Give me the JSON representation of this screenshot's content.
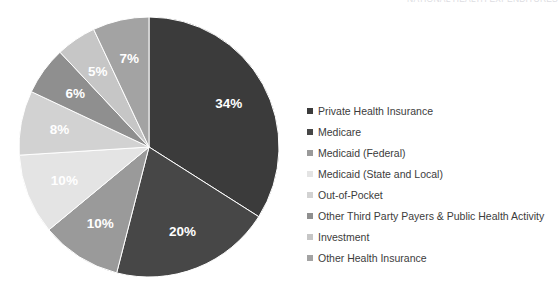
{
  "top_clipped_title": "NATIONAL HEALTH EXPENDITURES",
  "chart_data": {
    "type": "pie",
    "title": "",
    "start_angle_deg": 0,
    "direction": "clockwise",
    "legend_position": "right",
    "categories": [
      "Private Health Insurance",
      "Medicare",
      "Medicaid (Federal)",
      "Medicaid (State and Local)",
      "Out-of-Pocket",
      "Other Third Party Payers & Public Health Activity",
      "Investment",
      "Other Health Insurance"
    ],
    "values": [
      34,
      20,
      10,
      10,
      8,
      6,
      5,
      7
    ],
    "data_labels": [
      "34%",
      "20%",
      "10%",
      "10%",
      "8%",
      "6%",
      "5%",
      "7%"
    ],
    "colors": [
      "#3b3b3b",
      "#474747",
      "#9a9a9a",
      "#e4e4e4",
      "#d2d2d2",
      "#8f8f8f",
      "#c6c6c6",
      "#a3a3a3"
    ],
    "label_colors": [
      "#ffffff",
      "#ffffff",
      "#ffffff",
      "#ffffff",
      "#ffffff",
      "#ffffff",
      "#ffffff",
      "#ffffff"
    ]
  },
  "legend": {
    "items": [
      {
        "label": "Private Health Insurance",
        "color": "#3b3b3b"
      },
      {
        "label": "Medicare",
        "color": "#474747"
      },
      {
        "label": "Medicaid (Federal)",
        "color": "#9a9a9a"
      },
      {
        "label": "Medicaid (State and Local)",
        "color": "#e4e4e4"
      },
      {
        "label": "Out-of-Pocket",
        "color": "#d2d2d2"
      },
      {
        "label": "Other Third Party Payers & Public Health Activity",
        "color": "#8f8f8f"
      },
      {
        "label": "Investment",
        "color": "#c6c6c6"
      },
      {
        "label": "Other Health Insurance",
        "color": "#a3a3a3"
      }
    ]
  }
}
